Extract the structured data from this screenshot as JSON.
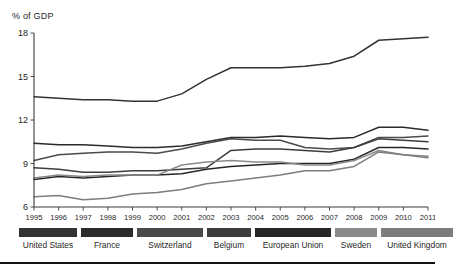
{
  "figure": {
    "axis_title": "% of GDP",
    "bottom_rule": true
  },
  "legend": {
    "position": "below-axis",
    "items": [
      {
        "label": "United States",
        "color": "#333333"
      },
      {
        "label": "France",
        "color": "#2b2b2b"
      },
      {
        "label": "Switzerland",
        "color": "#4a4a4a"
      },
      {
        "label": "Belgium",
        "color": "#3d3d3d"
      },
      {
        "label": "European Union",
        "color": "#262626"
      },
      {
        "label": "Sweden",
        "color": "#8a8a8a"
      },
      {
        "label": "United Kingdom",
        "color": "#7d7d7d"
      }
    ]
  },
  "chart_data": {
    "type": "line",
    "title": "",
    "xlabel": "",
    "ylabel": "% of GDP",
    "xlim": [
      1995,
      2011
    ],
    "ylim": [
      6,
      18
    ],
    "yticks": [
      6,
      9,
      12,
      15,
      18
    ],
    "ytick_labels": [
      "6",
      "9",
      "12",
      "15",
      "18"
    ],
    "grid": false,
    "x": [
      1995,
      1996,
      1997,
      1998,
      1999,
      2000,
      2001,
      2002,
      2003,
      2004,
      2005,
      2006,
      2007,
      2008,
      2009,
      2010,
      2011
    ],
    "xtick_labels": [
      "1995",
      "1996",
      "1997",
      "1998",
      "1999",
      "2000",
      "2001",
      "2002",
      "2003",
      "2004",
      "2005",
      "2006",
      "2007",
      "2008",
      "2009",
      "2010",
      "2011"
    ],
    "series": [
      {
        "name": "United States",
        "color": "#333333",
        "values": [
          13.6,
          13.5,
          13.4,
          13.4,
          13.3,
          13.3,
          13.8,
          14.8,
          15.6,
          15.6,
          15.6,
          15.7,
          15.9,
          16.4,
          17.5,
          17.6,
          17.7
        ]
      },
      {
        "name": "France",
        "color": "#2b2b2b",
        "values": [
          10.4,
          10.3,
          10.3,
          10.2,
          10.1,
          10.1,
          10.2,
          10.5,
          10.8,
          10.8,
          10.9,
          10.8,
          10.7,
          10.8,
          11.5,
          11.5,
          11.3
        ]
      },
      {
        "name": "Switzerland",
        "color": "#4a4a4a",
        "values": [
          9.2,
          9.6,
          9.7,
          9.8,
          9.8,
          9.7,
          10.0,
          10.4,
          10.7,
          10.6,
          10.6,
          10.1,
          10.0,
          10.1,
          10.8,
          10.8,
          10.9
        ]
      },
      {
        "name": "Belgium",
        "color": "#3d3d3d",
        "values": [
          8.7,
          8.6,
          8.4,
          8.4,
          8.5,
          8.5,
          8.6,
          8.7,
          9.9,
          10.0,
          10.0,
          9.9,
          9.8,
          10.1,
          10.7,
          10.6,
          10.5
        ]
      },
      {
        "name": "European Union",
        "color": "#262626",
        "values": [
          7.9,
          8.1,
          8.0,
          8.1,
          8.2,
          8.2,
          8.3,
          8.6,
          8.8,
          8.9,
          9.0,
          9.0,
          9.0,
          9.3,
          10.1,
          10.1,
          10.0
        ]
      },
      {
        "name": "Sweden",
        "color": "#8a8a8a",
        "values": [
          8.0,
          8.2,
          8.1,
          8.2,
          8.2,
          8.2,
          8.9,
          9.1,
          9.2,
          9.1,
          9.1,
          8.9,
          8.9,
          9.2,
          9.9,
          9.6,
          9.5
        ]
      },
      {
        "name": "United Kingdom",
        "color": "#7d7d7d",
        "values": [
          6.7,
          6.8,
          6.5,
          6.6,
          6.9,
          7.0,
          7.2,
          7.6,
          7.8,
          8.0,
          8.2,
          8.5,
          8.5,
          8.8,
          9.8,
          9.6,
          9.4
        ]
      }
    ]
  }
}
